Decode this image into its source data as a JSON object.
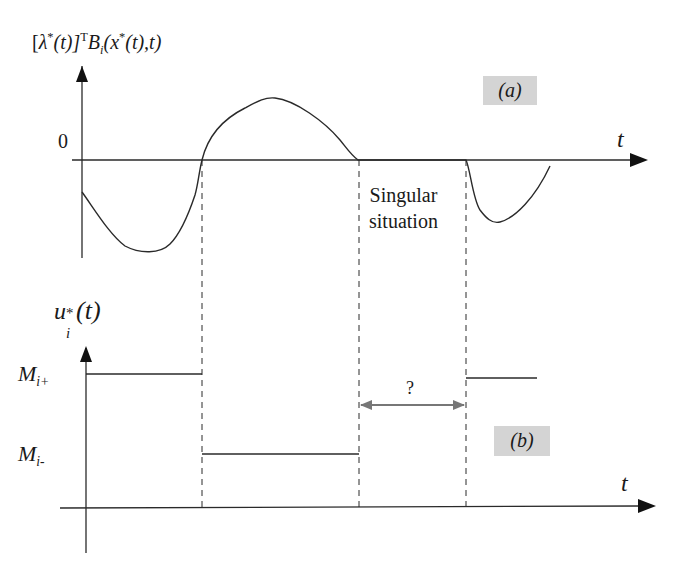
{
  "panel_a": {
    "tag": "(a)",
    "y_label": {
      "bracket_open": "[",
      "lambda": "λ",
      "star1": "*",
      "t_paren": "(t)]",
      "transpose": "T",
      "B": "B",
      "B_sub": "i",
      "args_open": "(x",
      "star2": "*",
      "args_close": "(t),t)"
    },
    "zero_label": "0",
    "x_axis_label": "t",
    "annotation_line1": "Singular",
    "annotation_line2": "situation"
  },
  "panel_b": {
    "tag": "(b)",
    "y_label": {
      "u": "u",
      "sup": "*",
      "sub": "i",
      "arg": "(t)"
    },
    "level_high": {
      "M": "M",
      "sub": "i+"
    },
    "level_low": {
      "M": "M",
      "sub": "i-"
    },
    "x_axis_label": "t",
    "unknown_interval_label": "?"
  },
  "colors": {
    "line": "#2a2a2a",
    "tag_bg": "#d4d4d4",
    "arrow_gray": "#777777"
  }
}
